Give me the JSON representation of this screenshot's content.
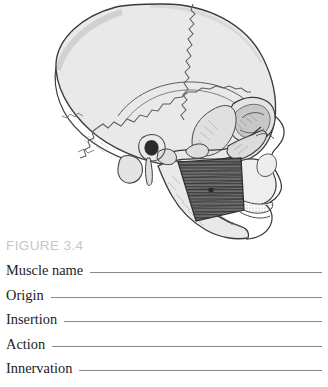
{
  "figure": {
    "caption": "FIGURE 3.4",
    "illustration_name": "lateral-skull-with-masseter-muscle",
    "highlighted_muscle": "masseter",
    "view": "lateral view of human skull, facing right",
    "colors": {
      "bone_fill": "#e9e9ea",
      "bone_outline": "#3c3c3c",
      "suture_line": "#5a5a5a",
      "muscle_fill": "#6e6e6e",
      "muscle_striation": "#3a3a3a",
      "caption_text": "#c6c6c6",
      "rule_line": "#888888",
      "label_text": "#1d1d1d",
      "background": "#ffffff"
    }
  },
  "worksheet": {
    "rows": [
      {
        "label": "Muscle name",
        "value": ""
      },
      {
        "label": "Origin",
        "value": ""
      },
      {
        "label": "Insertion",
        "value": ""
      },
      {
        "label": "Action",
        "value": ""
      },
      {
        "label": "Innervation",
        "value": ""
      }
    ]
  }
}
